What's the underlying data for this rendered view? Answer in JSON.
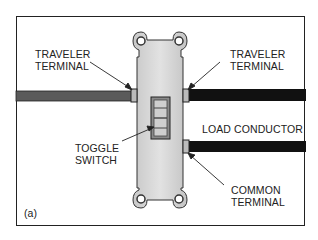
{
  "figure_label": "(a)",
  "labels": {
    "traveler_left": {
      "line1": "TRAVELER",
      "line2": "TERMINAL"
    },
    "traveler_right": {
      "line1": "TRAVELER",
      "line2": "TERMINAL"
    },
    "toggle_switch": {
      "line1": "TOGGLE",
      "line2": "SWITCH"
    },
    "load_conductor": "LOAD CONDUCTOR",
    "common_terminal": {
      "line1": "COMMON",
      "line2": "TERMINAL"
    }
  },
  "colors": {
    "frame": "#222222",
    "switch_body": "#d4d4d4",
    "left_wire": "#555555",
    "right_wires": "#111111",
    "terminal": "#bbbbbb"
  }
}
